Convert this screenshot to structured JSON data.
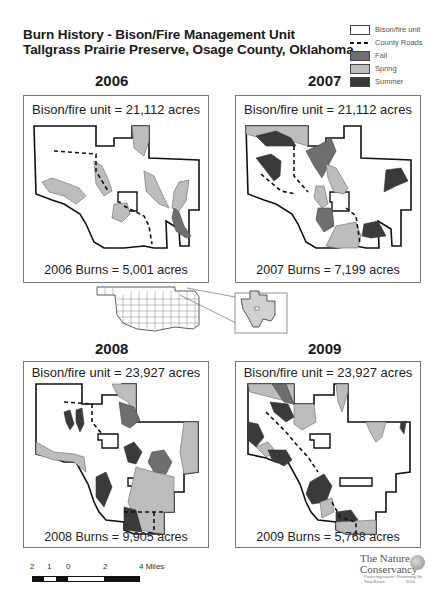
{
  "title": {
    "line1": "Burn History - Bison/Fire Management Unit",
    "line2": "Tallgrass Prairie Preserve, Osage County, Oklahoma"
  },
  "legend": {
    "items": [
      {
        "label": "Bison/fire unit",
        "type": "outline",
        "color": "#ffffff"
      },
      {
        "label": "County Roads",
        "type": "dashed-line",
        "color": "#111111"
      },
      {
        "label": "Fall",
        "type": "fill",
        "color": "#6e6e6e"
      },
      {
        "label": "Spring",
        "type": "fill",
        "color": "#bdbdbd"
      },
      {
        "label": "Summer",
        "type": "fill",
        "color": "#3a3a3a"
      }
    ]
  },
  "panels": [
    {
      "year": "2006",
      "unit_text": "Bison/fire unit = 21,112 acres",
      "burn_text": "2006 Burns = 5,001 acres"
    },
    {
      "year": "2007",
      "unit_text": "Bison/fire unit = 21,112 acres",
      "burn_text": "2007 Burns = 7,199 acres"
    },
    {
      "year": "2008",
      "unit_text": "Bison/fire unit = 23,927 acres",
      "burn_text": "2008 Burns = 9,905 acres"
    },
    {
      "year": "2009",
      "unit_text": "Bison/fire unit = 23,927 acres",
      "burn_text": "2009 Burns =  5,768 acres"
    }
  ],
  "scale": {
    "labels": [
      "2",
      "1",
      "0",
      "2",
      "4 Miles"
    ]
  },
  "logo": {
    "line1": "The Nature",
    "line2": "Conservancy",
    "tagline": "Protecting nature. Preserving life.",
    "author": "Tony Brown",
    "year": "2010"
  },
  "colors": {
    "fall": "#6e6e6e",
    "spring": "#bdbdbd",
    "summer": "#3a3a3a",
    "outline": "#111111",
    "frame": "#777777"
  }
}
